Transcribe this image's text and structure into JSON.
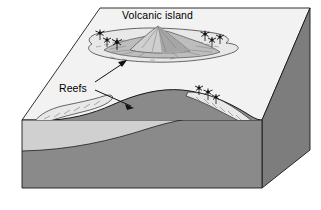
{
  "figure": {
    "kind": "block-diagram",
    "labels": {
      "volcanic_island": "Volcanic island",
      "reefs": "Reefs"
    },
    "icons": {
      "leader_arrow_upper": "arrow-icon",
      "leader_arrow_lower": "arrow-icon",
      "palm_tree": "palm-tree-icon",
      "volcano": "volcano-icon"
    },
    "colors": {
      "sea_surface": "#f2f2f2",
      "water_body": "#d0d0d0",
      "seafloor_rock": "#8a8a8a",
      "block_side": "#7d7d7d",
      "island_light": "#c9c9c9",
      "island_mid": "#a8a8a8",
      "island_dark": "#8f8f8f",
      "reef_fill": "#e8e8e8",
      "outline": "#1a1a1a",
      "label_text": "#000000",
      "background": "#ffffff"
    },
    "features": [
      {
        "name": "volcanic-island",
        "description": "Central cone with radial ridges, emergent"
      },
      {
        "name": "fringing-reef-island",
        "description": "Reef rim encircling the volcanic island"
      },
      {
        "name": "submerged-seamount",
        "description": "Foreground cross-section rise below sea level"
      },
      {
        "name": "fringing-reef-seamount",
        "description": "Reef caps on flanks of the foreground rise"
      },
      {
        "name": "palm-trees",
        "description": "Vegetation symbols on reef flats"
      }
    ],
    "palms_island": [
      {
        "x": 100,
        "y": 37
      },
      {
        "x": 106,
        "y": 43
      },
      {
        "x": 114,
        "y": 45
      },
      {
        "x": 205,
        "y": 38
      },
      {
        "x": 211,
        "y": 44
      },
      {
        "x": 219,
        "y": 41
      }
    ],
    "palms_seamount": [
      {
        "x": 199,
        "y": 95
      },
      {
        "x": 208,
        "y": 99
      },
      {
        "x": 216,
        "y": 101
      }
    ]
  }
}
